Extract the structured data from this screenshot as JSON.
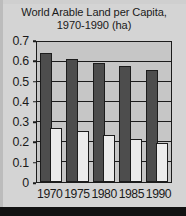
{
  "chart_data": {
    "type": "bar",
    "title": "World Arable Land per Capita, 1970-1990 (ha)",
    "title_lines": [
      "World Arable Land per Capita,",
      "1970-1990 (ha)"
    ],
    "xlabel": "",
    "ylabel": "",
    "categories": [
      "1970",
      "1975",
      "1980",
      "1985",
      "1990"
    ],
    "series": [
      {
        "name": "dark",
        "color": "#4d4d4d",
        "values": [
          0.645,
          0.615,
          0.597,
          0.58,
          0.562
        ]
      },
      {
        "name": "light",
        "color": "#ececec",
        "values": [
          0.272,
          0.255,
          0.237,
          0.214,
          0.193
        ]
      }
    ],
    "ylim": [
      0,
      0.7
    ],
    "yticks": [
      "0.7",
      "0.6",
      "0.5",
      "0.4",
      "0.3",
      "0.2",
      "0.1",
      "0"
    ],
    "ytick_values": [
      0.7,
      0.6,
      0.5,
      0.4,
      0.3,
      0.2,
      0.1,
      0
    ],
    "grid": true,
    "legend": "none",
    "plot_background": "#c6c6c6",
    "figure_background": "#d4d4d4",
    "axis_color": "#1c1c1c"
  }
}
